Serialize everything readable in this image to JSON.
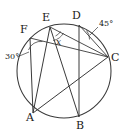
{
  "figure": {
    "type": "circle-geometry-diagram",
    "background_color": "#ffffff",
    "stroke_color": "#3a3a3a",
    "text_color": "#1a1a1a"
  },
  "circle": {
    "center_x": 64,
    "center_y": 71,
    "radius": 47,
    "stroke_width": 1
  },
  "points": [
    {
      "name": "F",
      "label": "F",
      "x": 30,
      "y": 38,
      "label_x": 20,
      "label_y": 24
    },
    {
      "name": "E",
      "label": "E",
      "x": 50,
      "y": 27,
      "label_x": 42,
      "label_y": 12
    },
    {
      "name": "D",
      "label": "D",
      "x": 79,
      "y": 25,
      "label_x": 72,
      "label_y": 10
    },
    {
      "name": "C",
      "label": "C",
      "x": 108,
      "y": 57,
      "label_x": 111,
      "label_y": 52
    },
    {
      "name": "A",
      "label": "A",
      "x": 33,
      "y": 113,
      "label_x": 26,
      "label_y": 112
    },
    {
      "name": "B",
      "label": "B",
      "x": 79,
      "y": 117,
      "label_x": 76,
      "label_y": 120
    }
  ],
  "chords": [
    {
      "name": "chord-F-A",
      "from": "F",
      "to": "A"
    },
    {
      "name": "chord-F-C",
      "from": "F",
      "to": "C"
    },
    {
      "name": "chord-E-A",
      "from": "E",
      "to": "A"
    },
    {
      "name": "chord-E-B",
      "from": "E",
      "to": "B"
    },
    {
      "name": "chord-E-C",
      "from": "E",
      "to": "C"
    },
    {
      "name": "chord-D-B",
      "from": "D",
      "to": "B"
    },
    {
      "name": "chord-D-C",
      "from": "D",
      "to": "C"
    },
    {
      "name": "chord-A-C",
      "from": "A",
      "to": "C"
    }
  ],
  "angles": [
    {
      "name": "angle-at-F",
      "label": "30°",
      "value": 30,
      "unit": "degrees",
      "vertex": "F",
      "label_x": 5,
      "label_y": 53
    },
    {
      "name": "angle-at-D",
      "label": "45°",
      "value": 45,
      "unit": "degrees",
      "vertex": "D",
      "label_x": 99,
      "label_y": 20
    },
    {
      "name": "angle-at-E-unknown",
      "label": "x",
      "value": null,
      "unit": "unknown",
      "vertex": "E",
      "label_x": 56,
      "label_y": 38
    }
  ]
}
